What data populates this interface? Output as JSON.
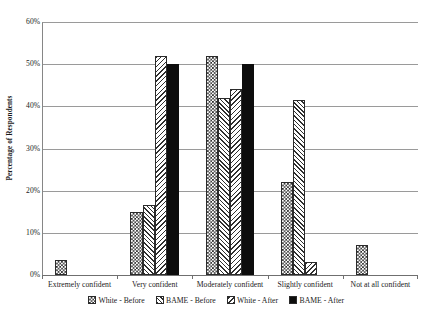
{
  "chart_data": {
    "type": "bar",
    "title": "",
    "subtitle": "",
    "xlabel": "",
    "ylabel": "Percentage of Respondents",
    "ylim": [
      0,
      60
    ],
    "y_tick_labels": [
      "0%",
      "10%",
      "20%",
      "30%",
      "40%",
      "50%",
      "60%"
    ],
    "y_tick_values": [
      0,
      10,
      20,
      30,
      40,
      50,
      60
    ],
    "grid": true,
    "legend_position": "bottom",
    "categories": [
      "Extremely confident",
      "Very confident",
      "Moderately confident",
      "Slightly confident",
      "Not at all confident"
    ],
    "series": [
      {
        "name": "White - Before",
        "pattern": "checker",
        "values": [
          3.5,
          15.0,
          52.0,
          22.0,
          7.0
        ]
      },
      {
        "name": "BAME - Before",
        "pattern": "hatch-up",
        "values": [
          0,
          16.5,
          42.0,
          41.5,
          0
        ]
      },
      {
        "name": "White - After",
        "pattern": "hatch-down",
        "values": [
          0,
          52.0,
          44.0,
          3.0,
          0
        ]
      },
      {
        "name": "BAME - After",
        "pattern": "solid-dots",
        "values": [
          0,
          50.0,
          50.0,
          0,
          0
        ]
      }
    ],
    "colors": {
      "bar_outline": "#2b2b2b",
      "bar_fill_dark": "#0d0d0d",
      "bar_fill_light": "#ffffff",
      "gridline": "#9a9a9a",
      "axis": "#6f6f6f",
      "text": "#1a1a1a",
      "background": "#ffffff"
    }
  }
}
